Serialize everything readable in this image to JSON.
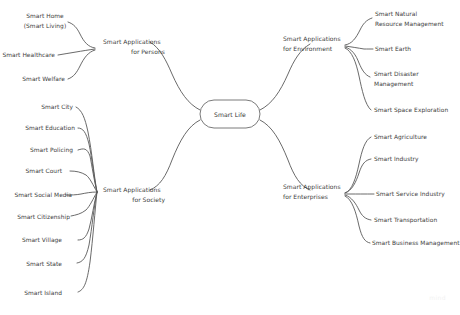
{
  "diagram": {
    "type": "mind-map",
    "background_color": "#ffffff",
    "line_color": "#595959",
    "text_color": "#3c3c3c",
    "root": {
      "label": "Smart Life",
      "shape": "rounded-rectangle"
    },
    "branches": [
      {
        "id": "persons",
        "label_line1": "Smart Applications",
        "label_line2": "for Persons",
        "side": "left",
        "children": [
          {
            "label_line1": "Smart Home",
            "label_line2": "(Smart Living)"
          },
          {
            "label_line1": "Smart Healthcare",
            "label_line2": ""
          },
          {
            "label_line1": "Smart Welfare",
            "label_line2": ""
          }
        ]
      },
      {
        "id": "society",
        "label_line1": "Smart Applications",
        "label_line2": "for Society",
        "side": "left",
        "children": [
          {
            "label_line1": "Smart City",
            "label_line2": ""
          },
          {
            "label_line1": "Smart Education",
            "label_line2": ""
          },
          {
            "label_line1": "Smart Policing",
            "label_line2": ""
          },
          {
            "label_line1": "Smart Court",
            "label_line2": ""
          },
          {
            "label_line1": "Smart Social Media",
            "label_line2": ""
          },
          {
            "label_line1": "Smart Citizenship",
            "label_line2": ""
          },
          {
            "label_line1": "Smart Village",
            "label_line2": ""
          },
          {
            "label_line1": "Smart State",
            "label_line2": ""
          },
          {
            "label_line1": "Smart Island",
            "label_line2": ""
          }
        ]
      },
      {
        "id": "environment",
        "label_line1": "Smart Applications",
        "label_line2": "for Environment",
        "side": "right",
        "children": [
          {
            "label_line1": "Smart Natural",
            "label_line2": "Resource Management"
          },
          {
            "label_line1": "Smart Earth",
            "label_line2": ""
          },
          {
            "label_line1": "Smart Disaster",
            "label_line2": "Management"
          },
          {
            "label_line1": "Smart Space Exploration",
            "label_line2": ""
          }
        ]
      },
      {
        "id": "enterprises",
        "label_line1": "Smart Applications",
        "label_line2": "for Enterprises",
        "side": "right",
        "children": [
          {
            "label_line1": "Smart Agriculture",
            "label_line2": ""
          },
          {
            "label_line1": "Smart Industry",
            "label_line2": ""
          },
          {
            "label_line1": "Smart Service Industry",
            "label_line2": ""
          },
          {
            "label_line1": "Smart Transportation",
            "label_line2": ""
          },
          {
            "label_line1": "Smart Business Management",
            "label_line2": ""
          }
        ]
      }
    ],
    "watermark": "mind"
  }
}
